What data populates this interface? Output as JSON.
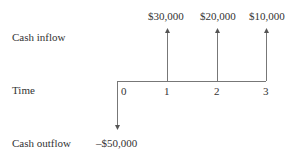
{
  "labels": {
    "cash_inflow": "Cash inflow",
    "time": "Time",
    "cash_outflow": "Cash outflow"
  },
  "time_ticks": [
    "0",
    "1",
    "2",
    "3"
  ],
  "inflows": [
    "$30,000",
    "$20,000",
    "$10,000"
  ],
  "outflow": "–$50,000"
}
